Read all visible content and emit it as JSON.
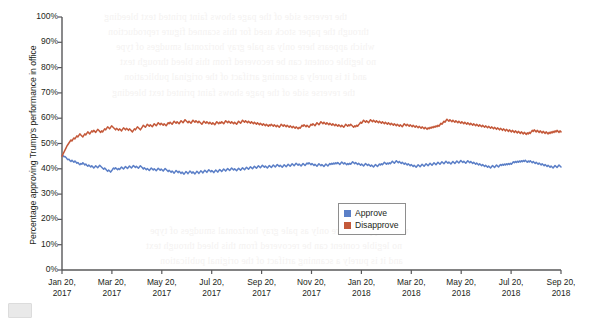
{
  "chart_data": {
    "type": "line",
    "title": "",
    "subtitle": "",
    "xlabel": "",
    "ylabel": "Percentage approving Trump's performance in office",
    "ylim": [
      0,
      100
    ],
    "ytick_labels": [
      "0%",
      "10%",
      "20%",
      "30%",
      "40%",
      "50%",
      "60%",
      "70%",
      "80%",
      "90%",
      "100%"
    ],
    "ytick_values": [
      0,
      10,
      20,
      30,
      40,
      50,
      60,
      70,
      80,
      90,
      100
    ],
    "xtick_labels": [
      "Jan 20,\n2017",
      "Mar 20,\n2017",
      "May 20,\n2017",
      "Jul 20,\n2017",
      "Sep 20,\n2017",
      "Nov 20,\n2017",
      "Jan 20,\n2018",
      "Mar 20,\n2018",
      "May 20,\n2018",
      "Jul 20,\n2018",
      "Sep 20,\n2018"
    ],
    "xticks": [
      {
        "line1": "Jan 20,",
        "line2": "2017"
      },
      {
        "line1": "Mar 20,",
        "line2": "2017"
      },
      {
        "line1": "May 20,",
        "line2": "2017"
      },
      {
        "line1": "Jul 20,",
        "line2": "2017"
      },
      {
        "line1": "Sep 20,",
        "line2": "2017"
      },
      {
        "line1": "Nov 20,",
        "line2": "2017"
      },
      {
        "line1": "Jan 20,",
        "line2": "2018"
      },
      {
        "line1": "Mar 20,",
        "line2": "2018"
      },
      {
        "line1": "May 20,",
        "line2": "2018"
      },
      {
        "line1": "Jul 20,",
        "line2": "2018"
      },
      {
        "line1": "Sep 20,",
        "line2": "2018"
      }
    ],
    "grid": false,
    "legend_position": "center",
    "colors": {
      "approve": "#5b7fc7",
      "disapprove": "#c4593a",
      "axis": "#58585a",
      "text": "#231f20"
    },
    "series": [
      {
        "name": "Approve",
        "color": "#5b7fc7",
        "values": [
          45.5,
          45.2,
          44.8,
          44.9,
          44.5,
          44.0,
          43.6,
          43.8,
          43.2,
          42.9,
          43.4,
          43.0,
          42.6,
          43.1,
          42.7,
          42.2,
          42.5,
          42.0,
          41.6,
          42.1,
          41.8,
          42.4,
          42.0,
          41.5,
          41.9,
          41.4,
          41.0,
          41.5,
          41.1,
          40.7,
          41.2,
          40.8,
          40.3,
          40.7,
          41.2,
          40.8,
          40.4,
          40.9,
          41.4,
          41.0,
          40.6,
          40.2,
          39.8,
          40.3,
          39.9,
          39.4,
          39.0,
          39.5,
          39.1,
          38.7,
          39.2,
          39.8,
          40.3,
          39.9,
          40.4,
          40.0,
          39.6,
          40.1,
          39.7,
          40.2,
          40.7,
          40.3,
          39.9,
          40.4,
          40.9,
          40.5,
          40.1,
          40.6,
          41.1,
          40.7,
          40.3,
          40.8,
          41.3,
          40.9,
          40.5,
          41.0,
          40.6,
          40.2,
          40.7,
          41.2,
          40.8,
          40.4,
          39.9,
          40.4,
          40.0,
          39.6,
          40.1,
          39.7,
          39.3,
          39.8,
          40.3,
          39.9,
          39.5,
          40.0,
          39.6,
          39.2,
          39.7,
          40.2,
          39.8,
          39.4,
          39.9,
          39.5,
          39.1,
          39.6,
          40.1,
          39.7,
          39.3,
          38.9,
          39.4,
          39.0,
          38.6,
          39.1,
          38.7,
          38.3,
          38.8,
          39.3,
          38.9,
          38.5,
          39.0,
          38.6,
          38.2,
          38.7,
          38.3,
          37.9,
          38.4,
          38.9,
          38.5,
          38.1,
          38.6,
          39.1,
          38.7,
          38.3,
          38.8,
          38.4,
          38.0,
          38.5,
          39.0,
          38.6,
          38.2,
          38.7,
          39.2,
          38.8,
          38.4,
          38.9,
          39.4,
          39.0,
          38.6,
          39.1,
          39.6,
          39.2,
          38.8,
          39.3,
          38.9,
          38.5,
          39.0,
          39.5,
          39.1,
          38.7,
          39.2,
          39.7,
          39.3,
          38.9,
          39.4,
          39.9,
          39.5,
          39.1,
          39.6,
          40.1,
          39.7,
          39.3,
          39.8,
          40.3,
          39.9,
          39.5,
          40.0,
          39.6,
          39.2,
          39.7,
          40.2,
          39.8,
          39.4,
          39.9,
          40.4,
          40.0,
          39.6,
          40.1,
          40.6,
          40.2,
          39.8,
          40.3,
          40.8,
          40.4,
          40.0,
          40.5,
          41.0,
          40.6,
          40.2,
          40.7,
          41.2,
          40.8,
          40.4,
          40.9,
          41.4,
          41.0,
          40.6,
          41.1,
          40.7,
          40.3,
          40.8,
          41.3,
          40.9,
          40.5,
          41.0,
          41.5,
          41.1,
          40.7,
          41.2,
          41.7,
          41.3,
          40.9,
          41.4,
          41.0,
          40.6,
          41.1,
          41.6,
          41.2,
          40.8,
          41.3,
          41.8,
          41.4,
          41.0,
          41.5,
          42.0,
          41.6,
          41.2,
          41.7,
          42.2,
          41.8,
          41.4,
          41.9,
          41.5,
          41.1,
          41.6,
          42.1,
          41.7,
          41.3,
          41.8,
          42.3,
          41.9,
          42.4,
          42.0,
          41.6,
          42.1,
          41.7,
          41.3,
          41.8,
          41.4,
          41.0,
          41.5,
          42.0,
          41.6,
          41.2,
          41.7,
          41.3,
          40.9,
          41.4,
          41.9,
          41.5,
          41.1,
          41.6,
          42.1,
          41.7,
          42.2,
          41.8,
          42.3,
          41.9,
          42.4,
          42.0,
          42.5,
          42.1,
          41.7,
          42.2,
          42.7,
          42.3,
          41.9,
          42.4,
          42.0,
          41.6,
          42.1,
          41.7,
          42.2,
          41.8,
          42.3,
          42.8,
          42.4,
          42.0,
          42.5,
          42.1,
          41.7,
          42.2,
          41.8,
          41.4,
          41.9,
          41.5,
          41.1,
          41.6,
          42.1,
          41.7,
          41.3,
          41.8,
          41.4,
          41.0,
          41.5,
          41.1,
          40.7,
          41.2,
          41.7,
          41.3,
          40.9,
          41.4,
          41.9,
          41.5,
          42.0,
          41.6,
          42.1,
          42.6,
          42.2,
          41.8,
          42.3,
          41.9,
          42.4,
          42.0,
          42.5,
          43.0,
          42.6,
          42.2,
          42.7,
          43.2,
          42.8,
          42.4,
          42.9,
          42.5,
          42.1,
          42.6,
          42.2,
          41.8,
          42.3,
          41.9,
          41.5,
          42.0,
          41.6,
          41.2,
          41.7,
          41.3,
          40.9,
          41.4,
          41.0,
          40.6,
          41.1,
          41.6,
          41.2,
          40.8,
          41.3,
          41.8,
          41.4,
          41.0,
          41.5,
          42.0,
          41.6,
          41.2,
          41.7,
          42.2,
          41.8,
          41.4,
          41.9,
          42.4,
          42.0,
          41.6,
          42.1,
          42.6,
          42.2,
          41.8,
          42.3,
          42.8,
          42.4,
          42.0,
          42.5,
          43.0,
          42.6,
          42.2,
          42.7,
          42.3,
          41.9,
          42.4,
          42.9,
          42.5,
          42.1,
          42.6,
          43.1,
          42.7,
          42.3,
          42.8,
          43.3,
          42.9,
          42.5,
          43.0,
          42.6,
          42.2,
          42.7,
          43.2,
          42.8,
          42.4,
          42.9,
          42.5,
          42.1,
          42.6,
          42.2,
          41.8,
          42.3,
          41.9,
          41.5,
          42.0,
          41.6,
          41.2,
          41.7,
          41.3,
          40.9,
          41.4,
          41.0,
          40.6,
          41.1,
          40.7,
          40.3,
          40.8,
          41.3,
          40.9,
          40.5,
          41.0,
          41.5,
          41.1,
          40.7,
          41.2,
          41.7,
          41.3,
          41.8,
          41.4,
          41.9,
          41.5,
          42.0,
          41.6,
          42.1,
          41.7,
          42.2,
          41.8,
          42.3,
          42.8,
          42.4,
          42.9,
          42.5,
          43.0,
          42.6,
          43.1,
          42.7,
          43.2,
          42.8,
          43.3,
          42.9,
          43.4,
          43.0,
          42.6,
          43.1,
          42.7,
          43.2,
          42.8,
          42.4,
          42.9,
          42.5,
          42.1,
          42.6,
          42.2,
          41.8,
          42.3,
          41.9,
          41.5,
          42.0,
          41.6,
          41.2,
          41.7,
          41.3,
          40.9,
          41.4,
          41.0,
          40.6,
          41.1,
          40.7,
          40.3,
          40.8,
          41.3,
          40.9,
          40.5,
          41.0,
          41.5,
          41.1,
          40.7
        ]
      },
      {
        "name": "Disapprove",
        "color": "#c4593a",
        "values": [
          45.0,
          45.8,
          46.6,
          47.4,
          48.2,
          49.0,
          49.6,
          50.2,
          50.8,
          51.4,
          51.0,
          51.6,
          52.2,
          51.8,
          52.4,
          53.0,
          52.6,
          53.2,
          53.8,
          53.4,
          53.0,
          52.6,
          53.2,
          53.8,
          53.4,
          54.0,
          54.6,
          54.2,
          53.8,
          54.4,
          55.0,
          54.6,
          55.2,
          54.8,
          54.4,
          55.0,
          55.6,
          55.2,
          54.8,
          54.4,
          55.0,
          54.6,
          55.2,
          55.8,
          55.4,
          56.0,
          56.6,
          56.2,
          55.8,
          56.4,
          57.0,
          56.6,
          56.2,
          55.8,
          55.4,
          56.0,
          55.6,
          55.2,
          55.8,
          55.4,
          55.0,
          55.6,
          56.2,
          55.8,
          55.4,
          56.0,
          55.6,
          55.2,
          55.8,
          55.4,
          55.0,
          54.6,
          55.2,
          55.8,
          55.4,
          56.0,
          56.6,
          56.2,
          55.8,
          55.4,
          56.0,
          56.6,
          57.2,
          56.8,
          56.4,
          57.0,
          57.6,
          57.2,
          56.8,
          57.4,
          57.0,
          56.6,
          57.2,
          57.8,
          57.4,
          57.0,
          57.6,
          58.2,
          57.8,
          57.4,
          58.0,
          57.6,
          57.2,
          57.8,
          57.4,
          57.0,
          57.6,
          58.2,
          57.8,
          58.4,
          58.0,
          57.6,
          58.2,
          58.8,
          58.4,
          58.0,
          58.6,
          58.2,
          57.8,
          58.4,
          59.0,
          58.6,
          58.2,
          58.8,
          59.4,
          59.0,
          58.6,
          58.2,
          58.8,
          58.4,
          58.0,
          58.6,
          59.2,
          58.8,
          58.4,
          59.0,
          58.6,
          58.2,
          58.8,
          58.4,
          58.0,
          57.6,
          58.2,
          58.8,
          58.4,
          58.0,
          58.6,
          58.2,
          57.8,
          58.4,
          58.0,
          57.6,
          58.2,
          57.8,
          57.4,
          58.0,
          58.6,
          58.2,
          57.8,
          58.4,
          58.0,
          58.6,
          58.2,
          57.8,
          58.4,
          59.0,
          58.6,
          58.2,
          58.8,
          58.4,
          58.0,
          58.6,
          58.2,
          57.8,
          58.4,
          58.0,
          57.6,
          58.2,
          58.8,
          58.4,
          58.0,
          58.6,
          59.2,
          58.8,
          58.4,
          59.0,
          58.6,
          58.2,
          58.8,
          58.4,
          58.0,
          58.6,
          58.2,
          57.8,
          58.4,
          58.0,
          57.6,
          58.2,
          57.8,
          57.4,
          58.0,
          57.6,
          57.2,
          57.8,
          57.4,
          57.0,
          57.6,
          57.2,
          56.8,
          57.4,
          57.0,
          57.6,
          57.2,
          56.8,
          57.4,
          57.0,
          56.6,
          57.2,
          56.8,
          56.4,
          57.0,
          57.6,
          57.2,
          56.8,
          57.4,
          57.0,
          56.6,
          57.2,
          56.8,
          56.4,
          57.0,
          56.6,
          56.2,
          56.8,
          56.4,
          56.0,
          56.6,
          56.2,
          55.8,
          56.4,
          56.0,
          56.6,
          57.2,
          56.8,
          57.4,
          57.0,
          56.6,
          57.2,
          56.8,
          56.4,
          57.0,
          57.6,
          57.2,
          57.8,
          57.4,
          57.0,
          57.6,
          58.2,
          57.8,
          57.4,
          58.0,
          58.6,
          58.2,
          57.8,
          58.4,
          58.0,
          57.6,
          58.2,
          57.8,
          57.4,
          58.0,
          57.6,
          57.2,
          57.8,
          57.4,
          57.0,
          57.6,
          57.2,
          56.8,
          57.4,
          57.0,
          56.6,
          57.2,
          56.8,
          56.4,
          57.0,
          57.6,
          57.2,
          56.8,
          57.4,
          57.0,
          57.6,
          57.2,
          56.8,
          56.4,
          57.0,
          56.6,
          57.2,
          56.8,
          57.4,
          57.8,
          58.4,
          58.0,
          58.6,
          59.2,
          58.8,
          58.4,
          59.0,
          58.6,
          58.2,
          58.8,
          59.4,
          59.0,
          58.6,
          59.2,
          58.8,
          58.4,
          59.0,
          58.6,
          58.2,
          58.8,
          58.4,
          58.0,
          58.6,
          58.2,
          57.8,
          58.4,
          58.0,
          57.6,
          58.2,
          57.8,
          57.4,
          58.0,
          57.6,
          57.2,
          57.8,
          57.4,
          57.0,
          57.6,
          57.2,
          56.8,
          57.4,
          57.0,
          56.6,
          57.2,
          57.8,
          57.4,
          57.0,
          57.6,
          57.2,
          56.8,
          57.4,
          57.0,
          56.6,
          57.2,
          56.8,
          56.4,
          57.0,
          56.6,
          56.2,
          56.8,
          56.4,
          56.0,
          56.6,
          56.2,
          55.8,
          56.4,
          56.0,
          55.6,
          56.2,
          55.8,
          56.4,
          56.0,
          56.6,
          56.2,
          56.8,
          56.4,
          57.0,
          56.6,
          57.2,
          56.8,
          57.4,
          58.0,
          57.6,
          58.2,
          58.8,
          58.4,
          59.0,
          59.6,
          59.2,
          58.8,
          59.4,
          59.0,
          58.6,
          59.2,
          58.8,
          58.4,
          59.0,
          58.6,
          58.2,
          58.8,
          58.4,
          58.0,
          58.6,
          58.2,
          57.8,
          58.4,
          58.0,
          57.6,
          58.2,
          57.8,
          57.4,
          58.0,
          57.6,
          57.2,
          57.8,
          57.4,
          57.0,
          57.6,
          57.2,
          56.8,
          57.4,
          57.0,
          56.6,
          57.2,
          56.8,
          56.4,
          57.0,
          56.6,
          56.2,
          56.8,
          56.4,
          56.0,
          56.6,
          56.2,
          55.8,
          56.4,
          56.0,
          55.6,
          56.2,
          55.8,
          55.4,
          56.0,
          55.6,
          55.2,
          55.8,
          55.4,
          55.0,
          55.6,
          55.2,
          54.8,
          55.4,
          55.0,
          54.6,
          55.2,
          54.8,
          54.4,
          55.0,
          54.6,
          54.2,
          54.8,
          54.4,
          54.0,
          54.6,
          54.2,
          53.8,
          54.4,
          54.0,
          53.6,
          54.2,
          53.8,
          54.4,
          54.0,
          54.6,
          55.2,
          54.8,
          55.4,
          55.0,
          54.6,
          55.2,
          54.8,
          54.4,
          55.0,
          54.6,
          54.2,
          54.8,
          54.4,
          54.0,
          54.6,
          54.2,
          53.8,
          54.4,
          54.0,
          54.6,
          54.2,
          54.8,
          54.4,
          55.0,
          54.6,
          55.2,
          54.8,
          54.4,
          55.0,
          54.6
        ]
      }
    ],
    "legend": [
      {
        "label": "Approve",
        "color": "#5b7fc7"
      },
      {
        "label": "Disapprove",
        "color": "#c4593a"
      }
    ]
  },
  "bleed_lines": [
    "the reverse side of the page shows faint printed text bleeding",
    "through the paper stock used for this scanned figure reproduction",
    "which appears here only as pale gray horizontal smudges of type",
    "no legible content can be recovered from this bleed through text",
    "and it is purely a scanning artifact of the original publication"
  ]
}
